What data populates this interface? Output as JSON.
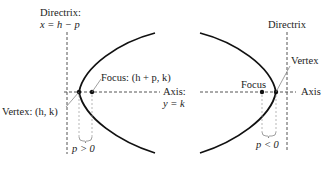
{
  "left_panel": {
    "directrix_title": "Directrix:",
    "directrix_equation": "x = h − p",
    "focus_label": "Focus: (h + p, k)",
    "axis_title": "Axis:",
    "axis_equation": "y = k",
    "vertex_label": "Vertex: (h, k)",
    "p_condition": "p > 0"
  },
  "right_panel": {
    "directrix_label": "Directrix",
    "vertex_label": "Vertex",
    "focus_label": "Focus",
    "axis_label": "Axis",
    "p_condition": "p < 0"
  },
  "colors": {
    "curve": "#111111",
    "dashed": "#555555",
    "leader": "#777777",
    "text": "#222222"
  }
}
